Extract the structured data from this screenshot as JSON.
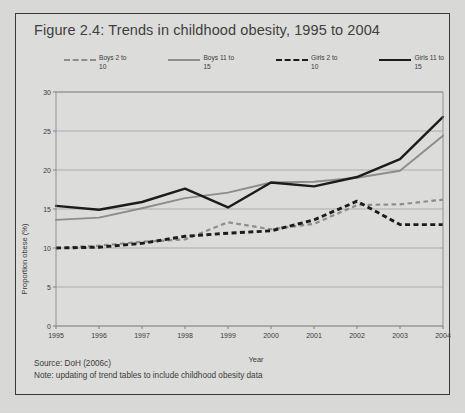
{
  "figure": {
    "title": "Figure 2.4: Trends in childhood obesity, 1995 to 2004",
    "source_line": "Source: DoH (2006c)",
    "note_line": "Note: updating of trend tables to include childhood obesity data"
  },
  "legend": {
    "items": [
      {
        "label": "Boys 2 to\n10",
        "key": "boys-2-10",
        "style": "dashed",
        "color": "#8d8d8d"
      },
      {
        "label": "Boys 11 to\n15",
        "key": "boys-11-15",
        "style": "solid",
        "color": "#8d8d8d"
      },
      {
        "label": "Girls 2 to\n10",
        "key": "girls-2-10",
        "style": "dashed",
        "color": "#1c1c1c"
      },
      {
        "label": "Girls 11 to\n15",
        "key": "girls-11-15",
        "style": "solid",
        "color": "#1c1c1c"
      }
    ]
  },
  "chart_data": {
    "type": "line",
    "title": "Figure 2.4: Trends in childhood obesity, 1995 to 2004",
    "xlabel": "Year",
    "ylabel": "Proportion obese (%)",
    "categories": [
      "1995",
      "1996",
      "1997",
      "1998",
      "1999",
      "2000",
      "2001",
      "2002",
      "2003",
      "2004"
    ],
    "x": [
      1995,
      1996,
      1997,
      1998,
      1999,
      2000,
      2001,
      2002,
      2003,
      2004
    ],
    "xlim": [
      1995,
      2004
    ],
    "ylim": [
      0,
      30
    ],
    "yticks": [
      0,
      5,
      10,
      15,
      20,
      25,
      30
    ],
    "xticks": [
      "1995",
      "1996",
      "1997",
      "1998",
      "1999",
      "2000",
      "2001",
      "2002",
      "2003",
      "2004"
    ],
    "grid": "horizontal",
    "legend_position": "top",
    "series": [
      {
        "name": "Boys 2 to 10",
        "color": "#8d8d8d",
        "style": "dashed",
        "values": [
          10.0,
          10.3,
          10.8,
          11.1,
          13.3,
          12.4,
          13.1,
          15.5,
          15.6,
          16.2
        ]
      },
      {
        "name": "Boys 11 to 15",
        "color": "#8d8d8d",
        "style": "solid",
        "values": [
          13.6,
          13.9,
          15.1,
          16.4,
          17.1,
          18.4,
          18.5,
          19.0,
          19.9,
          24.4
        ]
      },
      {
        "name": "Girls 2 to 10",
        "color": "#1c1c1c",
        "style": "dashed",
        "values": [
          10.0,
          10.1,
          10.6,
          11.5,
          11.9,
          12.2,
          13.6,
          16.0,
          13.0,
          13.0
        ]
      },
      {
        "name": "Girls 11 to 15",
        "color": "#1c1c1c",
        "style": "solid",
        "values": [
          15.4,
          14.9,
          15.9,
          17.6,
          15.2,
          18.4,
          17.9,
          19.1,
          21.4,
          26.8
        ]
      }
    ]
  }
}
